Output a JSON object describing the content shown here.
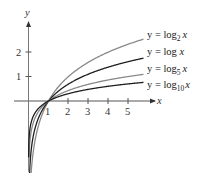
{
  "chart_data": {
    "type": "line",
    "title": "",
    "xlabel": "x",
    "ylabel": "y",
    "x_ticks": [
      "1",
      "2",
      "3",
      "4",
      "5"
    ],
    "y_ticks": [
      "1",
      "2"
    ],
    "xlim": [
      0,
      6.4
    ],
    "ylim": [
      -3,
      4
    ],
    "grid": false,
    "legend_position": "right, inline labels at curve ends",
    "series": [
      {
        "name": "y = log2 x",
        "base": 2,
        "color": "#8a8a8a",
        "label_main": "y = log",
        "label_sub": "2",
        "label_var": "x"
      },
      {
        "name": "y = log x",
        "base": 2.718281828,
        "color": "#1e1e1e",
        "label_main": "y = log ",
        "label_sub": "",
        "label_var": "x"
      },
      {
        "name": "y = log5 x",
        "base": 5,
        "color": "#8a8a8a",
        "label_main": "y = log",
        "label_sub": "5",
        "label_var": "x"
      },
      {
        "name": "y = log10 x",
        "base": 10,
        "color": "#1e1e1e",
        "label_main": "y = log",
        "label_sub": "10",
        "label_var": "x"
      }
    ],
    "sample_points": {
      "x": [
        0.05,
        0.5,
        1,
        2,
        3,
        4,
        5,
        5.75
      ],
      "log2": [
        -4.32,
        -1.0,
        0,
        1.0,
        1.585,
        2.0,
        2.322,
        2.524
      ],
      "ln": [
        -3.0,
        -0.693,
        0,
        0.693,
        1.099,
        1.386,
        1.609,
        1.749
      ],
      "log5": [
        -1.861,
        -0.431,
        0,
        0.431,
        0.683,
        0.861,
        1.0,
        1.087
      ],
      "log10": [
        -1.301,
        -0.301,
        0,
        0.301,
        0.477,
        0.602,
        0.699,
        0.76
      ]
    }
  }
}
